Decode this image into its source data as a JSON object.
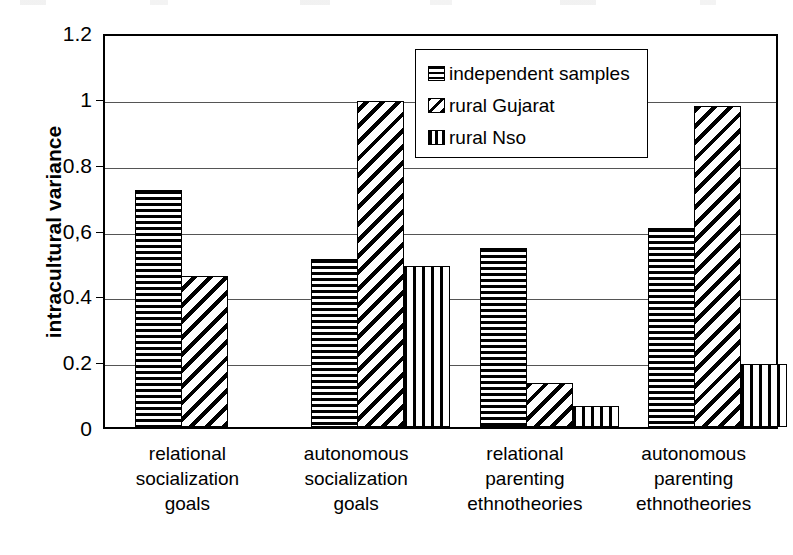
{
  "chart_data": {
    "type": "bar",
    "title": "",
    "subtitle": "",
    "xlabel": "",
    "ylabel": "intracultural variance",
    "ylim": [
      0,
      1.2
    ],
    "grid": true,
    "legend_position": "top-center",
    "y_ticks": [
      "0",
      "0.2",
      "0.4",
      "0,6",
      "0.8",
      "1",
      "1.2"
    ],
    "y_tick_values": [
      0,
      0.2,
      0.4,
      0.6,
      0.8,
      1,
      1.2
    ],
    "categories": [
      "relational\nsocialization\ngoals",
      "autonomous\nsocialization\ngoals",
      "relational\nparenting\nethnotheories",
      "autonomous\nparenting\nethnotheories"
    ],
    "series": [
      {
        "name": "independent samples",
        "pattern": "horizontal-stripes",
        "values": [
          0.72,
          0.51,
          0.545,
          0.605
        ]
      },
      {
        "name": "rural Gujarat",
        "pattern": "diagonal-hatch",
        "values": [
          0.46,
          0.99,
          0.135,
          0.975
        ]
      },
      {
        "name": "rural Nso",
        "pattern": "vertical-stripes",
        "values": [
          null,
          0.49,
          0.065,
          0.19
        ]
      }
    ]
  },
  "legend": {
    "items": [
      {
        "label": "independent samples",
        "pattern": "horizontal-stripes"
      },
      {
        "label": "rural Gujarat",
        "pattern": "diagonal-hatch"
      },
      {
        "label": "rural Nso",
        "pattern": "vertical-stripes"
      }
    ]
  }
}
